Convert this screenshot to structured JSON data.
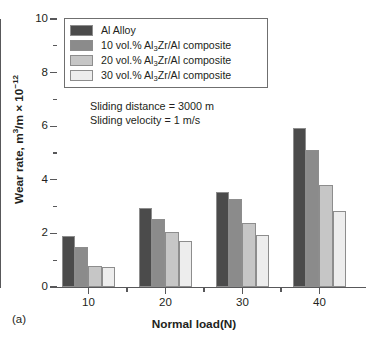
{
  "panel_label": "(a)",
  "annotation": {
    "line1": "Sliding distance = 3000 m",
    "line2": "Sliding velocity = 1 m/s"
  },
  "axes": {
    "y_title_prefix": "Wear rate, m",
    "y_title_mid": "/m × 10",
    "x_title": "Normal load(N)",
    "y_ticks": [
      "0",
      "2",
      "4",
      "6",
      "8",
      "10"
    ],
    "x_ticks": [
      "10",
      "20",
      "30",
      "40"
    ]
  },
  "legend": {
    "entries": [
      {
        "label": "Al Alloy",
        "color": "#4b4b4b",
        "pre": "Al Alloy",
        "sub": "",
        "post": ""
      },
      {
        "label": "10 vol.% Al3Zr/Al composite",
        "color": "#8b8b8b",
        "pre": "10 vol.% Al",
        "sub": "3",
        "post": "Zr/Al composite"
      },
      {
        "label": "20 vol.% Al3Zr/Al composite",
        "color": "#c6c6c6",
        "pre": "20 vol.% Al",
        "sub": "3",
        "post": "Zr/Al composite"
      },
      {
        "label": "30 vol.% Al3Zr/Al composite",
        "color": "#ededed",
        "pre": "30 vol.% Al",
        "sub": "3",
        "post": "Zr/Al composite"
      }
    ]
  },
  "chart_data": {
    "type": "bar",
    "title": "",
    "xlabel": "Normal load(N)",
    "ylabel": "Wear rate, m³/m × 10⁻¹²",
    "categories": [
      "10",
      "20",
      "30",
      "40"
    ],
    "ylim": [
      0,
      10
    ],
    "ytick_step": 2,
    "yminor_step": 1,
    "grid": false,
    "legend_position": "top-left-inside",
    "annotations": [
      "Sliding distance = 3000 m",
      "Sliding velocity = 1 m/s",
      "(a)"
    ],
    "series": [
      {
        "name": "Al Alloy",
        "color": "#4b4b4b",
        "values": [
          1.9,
          2.95,
          3.55,
          5.95
        ]
      },
      {
        "name": "10 vol.% Al3Zr/Al composite",
        "color": "#8b8b8b",
        "values": [
          1.5,
          2.55,
          3.3,
          5.1
        ]
      },
      {
        "name": "20 vol.% Al3Zr/Al composite",
        "color": "#c6c6c6",
        "values": [
          0.8,
          2.05,
          2.4,
          3.8
        ]
      },
      {
        "name": "30 vol.% Al3Zr/Al composite",
        "color": "#ededed",
        "values": [
          0.75,
          1.7,
          1.95,
          2.85
        ]
      }
    ]
  }
}
